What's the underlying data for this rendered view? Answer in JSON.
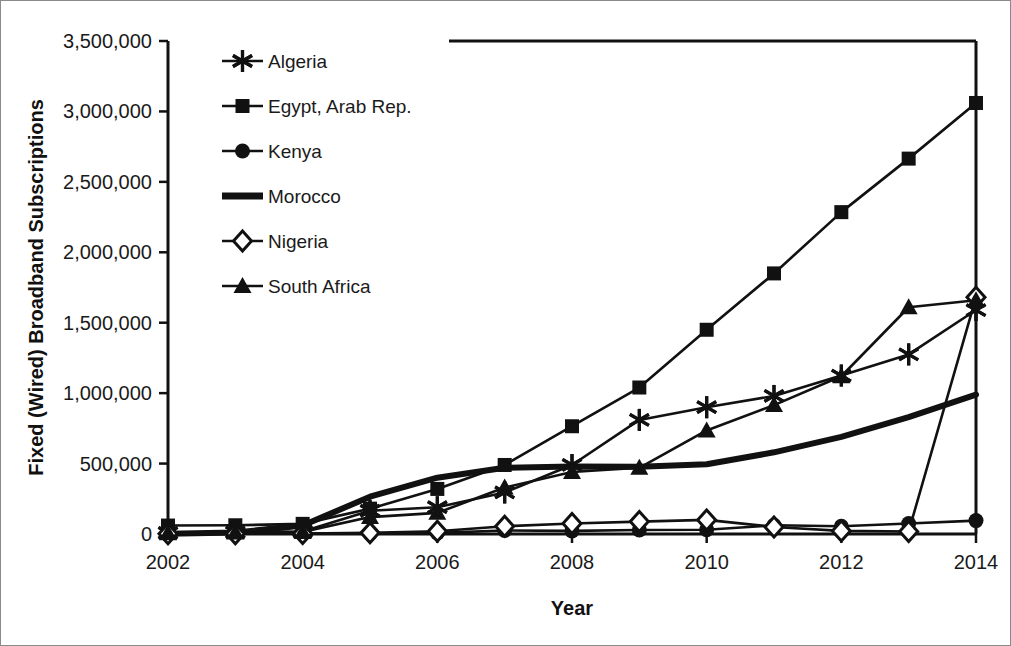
{
  "chart_data": {
    "type": "line",
    "title": "",
    "xlabel": "Year",
    "ylabel": "Fixed (Wired) Broadband Subscriptions",
    "x": [
      2002,
      2003,
      2004,
      2005,
      2006,
      2007,
      2008,
      2009,
      2010,
      2011,
      2012,
      2013,
      2014
    ],
    "xtick_labels": [
      "2002",
      "2004",
      "2006",
      "2008",
      "2010",
      "2012",
      "2014"
    ],
    "xticks": [
      2002,
      2004,
      2006,
      2008,
      2010,
      2012,
      2014
    ],
    "ytick_labels": [
      "0",
      "500,000",
      "1,000,000",
      "1,500,000",
      "2,000,000",
      "2,500,000",
      "3,000,000",
      "3,500,000"
    ],
    "yticks": [
      0,
      500000,
      1000000,
      1500000,
      2000000,
      2500000,
      3000000,
      3500000
    ],
    "xlim": [
      2002,
      2014
    ],
    "ylim": [
      0,
      3500000
    ],
    "grid": false,
    "legend_position": "top-left-inside",
    "series": [
      {
        "name": "Algeria",
        "marker": "asterisk",
        "values": [
          8000,
          12000,
          18000,
          165000,
          190000,
          295000,
          490000,
          810000,
          900000,
          980000,
          1125000,
          1275000,
          1590000
        ]
      },
      {
        "name": "Egypt, Arab Rep.",
        "marker": "square",
        "values": [
          60000,
          62000,
          72000,
          180000,
          320000,
          490000,
          765000,
          1040000,
          1450000,
          1850000,
          2285000,
          2665000,
          3060000
        ]
      },
      {
        "name": "Kenya",
        "marker": "circle",
        "values": [
          1000,
          1500,
          2000,
          3000,
          8000,
          25000,
          22000,
          28000,
          30000,
          62000,
          55000,
          75000,
          95000
        ]
      },
      {
        "name": "Morocco",
        "marker": "none",
        "values": [
          1000,
          10000,
          60000,
          265000,
          400000,
          470000,
          480000,
          478000,
          495000,
          580000,
          690000,
          830000,
          990000
        ]
      },
      {
        "name": "Nigeria",
        "marker": "diamond-open",
        "values": [
          1000,
          2000,
          4000,
          8000,
          20000,
          55000,
          75000,
          88000,
          100000,
          50000,
          22000,
          18000,
          1680000
        ]
      },
      {
        "name": "South Africa",
        "marker": "triangle",
        "values": [
          5000,
          10000,
          15000,
          120000,
          150000,
          330000,
          440000,
          470000,
          735000,
          915000,
          1120000,
          1610000,
          1660000
        ]
      }
    ]
  }
}
